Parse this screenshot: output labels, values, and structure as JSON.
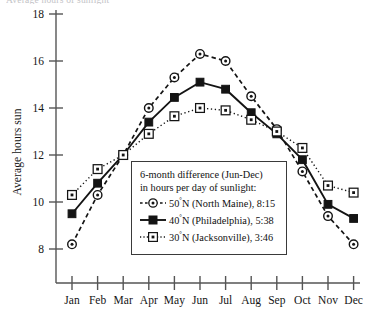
{
  "page": {
    "clipped_header_text": "Average hours of sunlight"
  },
  "chart_data": {
    "type": "line",
    "title": "",
    "xlabel": "",
    "ylabel": "Average hours sun",
    "categories": [
      "Jan",
      "Feb",
      "Mar",
      "Apr",
      "May",
      "Jun",
      "Jul",
      "Aug",
      "Sep",
      "Oct",
      "Nov",
      "Dec"
    ],
    "ylim": [
      7,
      18
    ],
    "yticks": [
      8,
      10,
      12,
      14,
      16,
      18
    ],
    "ytick_labels": [
      "8",
      "10",
      "12",
      "14",
      "16",
      "18"
    ],
    "grid": false,
    "legend_position": "inside-bottom-center",
    "series": [
      {
        "name": "50°N (North Maine), 8:15",
        "latitude_label": "50",
        "degree": "°",
        "location": "N (North Maine), 8:15",
        "marker": "circle-dot",
        "line_style": "dashed",
        "values": [
          8.2,
          10.3,
          12.0,
          14.0,
          15.3,
          16.3,
          16.0,
          14.5,
          13.1,
          11.3,
          9.4,
          8.2
        ]
      },
      {
        "name": "40°N (Philadelphia), 5:38",
        "latitude_label": "40",
        "degree": "°",
        "location": "N (Philadelphia), 5:38",
        "marker": "filled-square",
        "line_style": "solid",
        "values": [
          9.5,
          10.8,
          12.0,
          13.4,
          14.45,
          15.1,
          14.8,
          13.8,
          12.9,
          11.8,
          9.9,
          9.3
        ]
      },
      {
        "name": "30°N (Jacksonville), 3:46",
        "latitude_label": "30",
        "degree": "°",
        "location": "N (Jacksonville), 3:46",
        "marker": "open-square-dot",
        "line_style": "dotted",
        "values": [
          10.3,
          11.4,
          12.0,
          12.9,
          13.65,
          14.0,
          13.9,
          13.5,
          13.0,
          12.3,
          10.7,
          10.4
        ]
      }
    ],
    "annotations": {
      "legend_title_line1": "6-month difference (Jun-Dec)",
      "legend_title_line2": "in hours per day of sunlight:"
    },
    "colors": {
      "ink": "#141414",
      "axis": "#555555",
      "background": "#ffffff"
    }
  }
}
